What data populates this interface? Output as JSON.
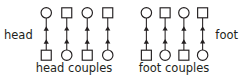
{
  "figure": {
    "side_labels": {
      "head": "head",
      "foot": "foot"
    },
    "captions": {
      "head_group": "head couples",
      "foot_group": "foot couples"
    }
  },
  "chart_data": {
    "type": "diagram",
    "title": "",
    "colors": {
      "stroke": "#231f20",
      "fill": "#ffffff",
      "background": "#ffffff",
      "text": "#231f20"
    },
    "groups": [
      {
        "id": "head-couples",
        "caption": "head couples",
        "side_label": "head",
        "side_label_position": "left",
        "columns": [
          {
            "index": 1,
            "top_shape": "circle",
            "bottom_shape": "square",
            "arrow_direction": "up",
            "arrow_count": 2
          },
          {
            "index": 2,
            "top_shape": "square",
            "bottom_shape": "circle",
            "arrow_direction": "up",
            "arrow_count": 2
          },
          {
            "index": 3,
            "top_shape": "circle",
            "bottom_shape": "square",
            "arrow_direction": "up",
            "arrow_count": 2
          },
          {
            "index": 4,
            "top_shape": "square",
            "bottom_shape": "circle",
            "arrow_direction": "up",
            "arrow_count": 2
          }
        ]
      },
      {
        "id": "foot-couples",
        "caption": "foot couples",
        "side_label": "foot",
        "side_label_position": "right",
        "columns": [
          {
            "index": 1,
            "top_shape": "circle",
            "bottom_shape": "square",
            "arrow_direction": "up",
            "arrow_count": 2
          },
          {
            "index": 2,
            "top_shape": "square",
            "bottom_shape": "circle",
            "arrow_direction": "up",
            "arrow_count": 2
          },
          {
            "index": 3,
            "top_shape": "circle",
            "bottom_shape": "square",
            "arrow_direction": "up",
            "arrow_count": 2
          },
          {
            "index": 4,
            "top_shape": "square",
            "bottom_shape": "circle",
            "arrow_direction": "up",
            "arrow_count": 2
          }
        ]
      }
    ]
  }
}
